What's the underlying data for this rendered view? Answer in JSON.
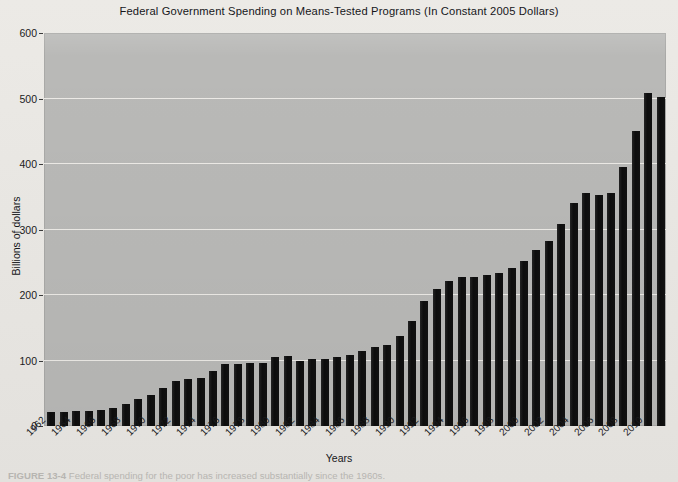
{
  "figure": {
    "title": "Federal Government Spending on Means-Tested Programs (In Constant 2005 Dollars)",
    "caption_label": "FIGURE 13-4",
    "caption_text": "Federal spending for the poor has increased substantially since the 1960s.",
    "bar_color": "#141414",
    "plot_background": "#b9b9b7",
    "page_background": "#e9e8e4",
    "gridline_color": "#eceae6"
  },
  "chart_data": {
    "type": "bar",
    "title": "Federal Government Spending on Means-Tested Programs (In Constant 2005 Dollars)",
    "xlabel": "Years",
    "ylabel": "Billions of dollars",
    "ylim": [
      0,
      600
    ],
    "yticks": [
      0,
      100,
      200,
      300,
      400,
      500,
      600
    ],
    "ytick_labels": [
      "0",
      "100",
      "200",
      "300",
      "400",
      "500",
      "600"
    ],
    "grid": true,
    "legend": null,
    "xtick_labels": [
      "1962",
      "1964",
      "1966",
      "1968",
      "1970",
      "1972",
      "1974",
      "1976",
      "1978",
      "1980",
      "1982",
      "1984",
      "1986",
      "1988",
      "1990",
      "1992",
      "1994",
      "1996",
      "1998",
      "2000",
      "2002",
      "2004",
      "2006",
      "2008",
      "2010"
    ],
    "xtick_step_years": 2,
    "categories": [
      "1962",
      "1963",
      "1964",
      "1965",
      "1966",
      "1967",
      "1968",
      "1969",
      "1970",
      "1971",
      "1972",
      "1973",
      "1974",
      "1975",
      "1976",
      "1977",
      "1978",
      "1979",
      "1980",
      "1981",
      "1982",
      "1983",
      "1984",
      "1985",
      "1986",
      "1987",
      "1988",
      "1989",
      "1990",
      "1991",
      "1992",
      "1993",
      "1994",
      "1995",
      "1996",
      "1997",
      "1998",
      "1999",
      "2000",
      "2001",
      "2002",
      "2003",
      "2004",
      "2005",
      "2006",
      "2007",
      "2008",
      "2009",
      "2010",
      "2011"
    ],
    "values": [
      21,
      22,
      23,
      23,
      25,
      28,
      34,
      41,
      48,
      58,
      68,
      72,
      74,
      84,
      94,
      95,
      96,
      96,
      105,
      107,
      100,
      103,
      103,
      105,
      108,
      114,
      121,
      124,
      137,
      160,
      191,
      209,
      222,
      228,
      227,
      230,
      234,
      241,
      252,
      268,
      283,
      308,
      340,
      355,
      352,
      355,
      395,
      450,
      508,
      502
    ]
  }
}
